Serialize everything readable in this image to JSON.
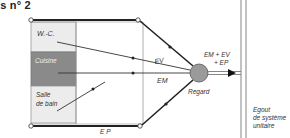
{
  "title": "is n° 2",
  "rooms": {
    "wc": "W.-C.",
    "kitchen": "Cuisine",
    "bathroom_line1": "Salle",
    "bathroom_line2": "de bain"
  },
  "pipes": {
    "ev": "EV",
    "em": "EM",
    "ep": "E P"
  },
  "manhole": "Regard",
  "combined_flow": {
    "line1": "EM + EV",
    "line2": "+ EP"
  },
  "sewer": {
    "line1": "Egout",
    "line2": "de système",
    "line3": "unitaire"
  },
  "colors": {
    "kitchen_fill": "#8a8a8a",
    "wc_fill": "#ececec",
    "bathroom_fill": "#ececec",
    "manhole_fill": "#9a9a9a",
    "line": "#222222"
  }
}
